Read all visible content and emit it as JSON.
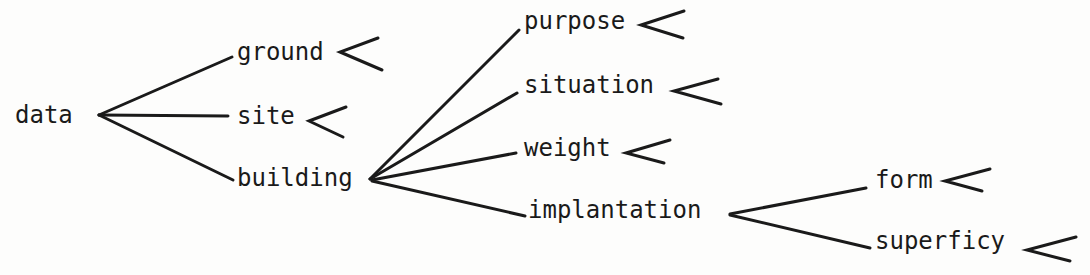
{
  "diagram": {
    "type": "tree",
    "colors": {
      "ink": "#1a1a1a",
      "paper": "#fdfdfc"
    },
    "nodes": {
      "data": {
        "label": "data"
      },
      "ground": {
        "label": "ground"
      },
      "site": {
        "label": "site"
      },
      "building": {
        "label": "building"
      },
      "purpose": {
        "label": "purpose"
      },
      "situation": {
        "label": "situation"
      },
      "weight": {
        "label": "weight"
      },
      "implantation": {
        "label": "implantation"
      },
      "form": {
        "label": "form"
      },
      "superficy": {
        "label": "superficy"
      }
    },
    "edges": [
      [
        "data",
        "ground"
      ],
      [
        "data",
        "site"
      ],
      [
        "data",
        "building"
      ],
      [
        "building",
        "purpose"
      ],
      [
        "building",
        "situation"
      ],
      [
        "building",
        "weight"
      ],
      [
        "building",
        "implantation"
      ],
      [
        "implantation",
        "form"
      ],
      [
        "implantation",
        "superficy"
      ]
    ],
    "open_branch_markers": [
      "ground",
      "site",
      "purpose",
      "situation",
      "weight",
      "form",
      "superficy"
    ]
  }
}
